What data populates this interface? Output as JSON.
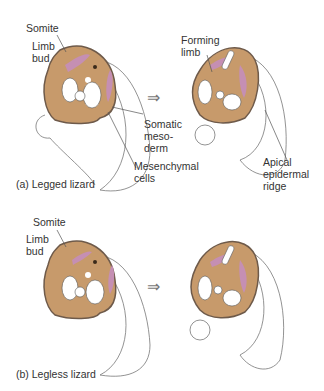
{
  "colors": {
    "tissue": "#c79a6b",
    "tissue_outline": "#6e5a4a",
    "somite": "#c58fb3",
    "line": "#555555",
    "background": "#ffffff"
  },
  "panels": [
    {
      "id": "a",
      "caption": "(a)   Legged lizard",
      "labels": {
        "somite": "Somite",
        "limb_bud": "Limb\nbud",
        "forming_limb": "Forming\nlimb",
        "somatic_mesoderm": "Somatic\nmeso-\nderm",
        "mesenchymal_cells": "Mesenchymal\ncells",
        "apical_epidermal_ridge": "Apical\nepidermal\nridge"
      },
      "arrow": "⇒"
    },
    {
      "id": "b",
      "caption": "(b)   Legless lizard",
      "labels": {
        "somite": "Somite",
        "limb_bud": "Limb\nbud"
      },
      "arrow": "⇒"
    }
  ]
}
